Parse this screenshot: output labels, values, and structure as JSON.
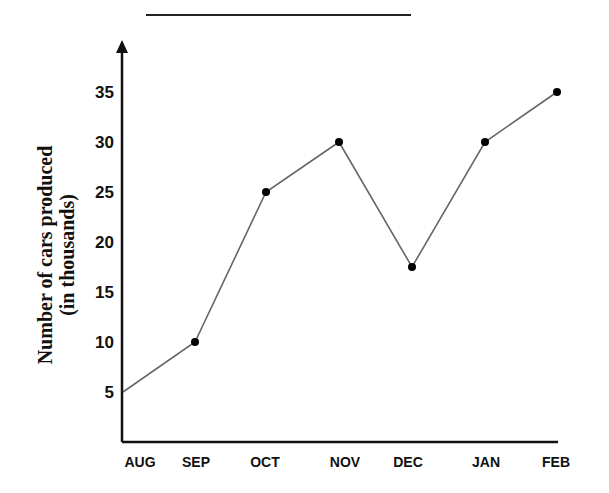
{
  "chart_data": {
    "type": "line",
    "title": "",
    "xlabel": "",
    "ylabel": "Number of cars produced (in thousands)",
    "ylabel_lines": [
      "Number of cars produced",
      "(in thousands)"
    ],
    "categories": [
      "AUG",
      "SEP",
      "OCT",
      "NOV",
      "DEC",
      "JAN",
      "FEB"
    ],
    "values": [
      5,
      10,
      25,
      30,
      17.5,
      30,
      35
    ],
    "yticks": [
      5,
      10,
      15,
      20,
      25,
      30,
      35
    ],
    "ylim": [
      0,
      39
    ],
    "grid": false,
    "legend": null,
    "markers": "dots on SEP–FEB points"
  },
  "colors": {
    "line": "#666666",
    "marker": "#000000",
    "axis": "#111111"
  }
}
